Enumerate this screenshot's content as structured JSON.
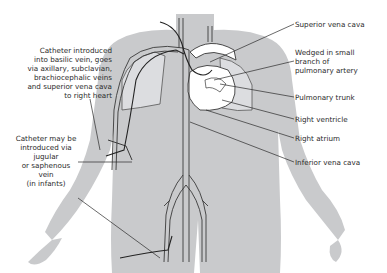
{
  "diagram": {
    "colors": {
      "body_silhouette": "#c9cacc",
      "vessel_fill": "#ffffff",
      "vessel_outline": "#3a3a3a",
      "leader_line": "#2a2a2a",
      "label_text": "#2a2a2a"
    },
    "labels": {
      "left": {
        "basilic": [
          "Catheter introduced",
          "into basilic vein, goes",
          "via axillary, subclavian,",
          "brachiocephalic veins",
          "and superior vena cava",
          "to right heart"
        ],
        "jugular": [
          "Catheter may be",
          "introduced via",
          "jugular",
          "or saphenous",
          "vein",
          "(in infants)"
        ]
      },
      "right": {
        "svc": "Superior vena cava",
        "wedged": [
          "Wedged in small",
          "branch of",
          "pulmonary artery"
        ],
        "pulmonary_trunk": "Pulmonary trunk",
        "right_ventricle": "Right ventricle",
        "right_atrium": "Right atrium",
        "ivc": "Inferior vena cava"
      }
    }
  }
}
